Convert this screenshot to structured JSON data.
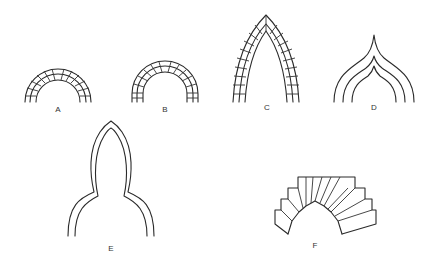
{
  "figure": {
    "arches": [
      {
        "id": "A",
        "label": "A",
        "type": "semicircular-voussoir",
        "label_pos": [
          58,
          108
        ]
      },
      {
        "id": "B",
        "label": "B",
        "type": "semicircular-stilted-voussoir",
        "label_pos": [
          165,
          108
        ]
      },
      {
        "id": "C",
        "label": "C",
        "type": "pointed-lancet-voussoir",
        "label_pos": [
          267,
          106
        ]
      },
      {
        "id": "D",
        "label": "D",
        "type": "ogee-triple-line",
        "label_pos": [
          374,
          106
        ]
      },
      {
        "id": "E",
        "label": "E",
        "type": "bulbous-horseshoe-pointed",
        "label_pos": [
          111,
          248
        ]
      },
      {
        "id": "F",
        "label": "F",
        "type": "stepped-voussoir-pointed",
        "label_pos": [
          315,
          244
        ]
      }
    ]
  }
}
